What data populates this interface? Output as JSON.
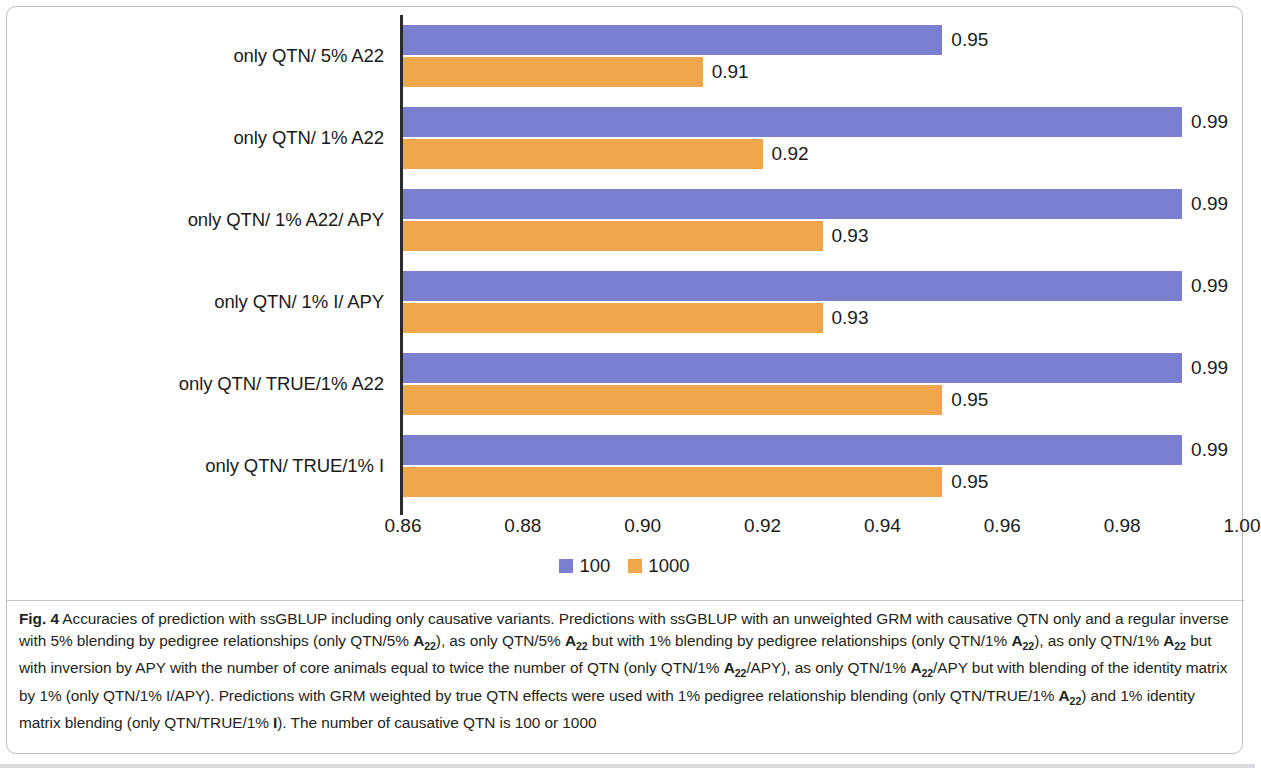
{
  "figure": {
    "label": "Fig. 4",
    "caption_segments": [
      {
        "text": "Fig. 4",
        "style": "bold"
      },
      {
        "text": "  Accuracies of prediction with ssGBLUP including only causative variants. Predictions with ssGBLUP with an unweighted GRM with causative QTN only and a regular inverse with 5% blending by pedigree relationships (only QTN/5% ",
        "style": "normal"
      },
      {
        "text": "A",
        "style": "matrix"
      },
      {
        "text": "22",
        "style": "subscript"
      },
      {
        "text": "), as only QTN/5% ",
        "style": "normal"
      },
      {
        "text": "A",
        "style": "matrix"
      },
      {
        "text": "22",
        "style": "subscript"
      },
      {
        "text": " but with 1% blending by pedigree relationships (only QTN/1% ",
        "style": "normal"
      },
      {
        "text": "A",
        "style": "matrix"
      },
      {
        "text": "22",
        "style": "subscript"
      },
      {
        "text": "), as only QTN/1% ",
        "style": "normal"
      },
      {
        "text": "A",
        "style": "matrix"
      },
      {
        "text": "22",
        "style": "subscript"
      },
      {
        "text": " but with inversion by APY with the number of core animals equal to twice the number of QTN (only QTN/1% ",
        "style": "normal"
      },
      {
        "text": "A",
        "style": "matrix"
      },
      {
        "text": "22",
        "style": "subscript"
      },
      {
        "text": "/APY), as only QTN/1% ",
        "style": "normal"
      },
      {
        "text": "A",
        "style": "matrix"
      },
      {
        "text": "22",
        "style": "subscript"
      },
      {
        "text": "/APY but with blending of the identity matrix by 1% (only QTN/1% I/APY). Predictions with GRM weighted by true QTN effects were used with 1% pedigree relationship blending (only QTN/TRUE/1% ",
        "style": "normal"
      },
      {
        "text": "A",
        "style": "matrix"
      },
      {
        "text": "22",
        "style": "subscript"
      },
      {
        "text": ") and 1% identity matrix blending (only QTN/TRUE/1% ",
        "style": "normal"
      },
      {
        "text": "I",
        "style": "matrix"
      },
      {
        "text": "). The number of causative QTN is 100 or 1000",
        "style": "normal"
      }
    ]
  },
  "chart_data": {
    "type": "bar",
    "orientation": "horizontal",
    "title": "",
    "xlabel": "",
    "ylabel": "",
    "xlim": [
      0.86,
      1.0
    ],
    "xticks": [
      "0.86",
      "0.88",
      "0.90",
      "0.92",
      "0.94",
      "0.96",
      "0.98",
      "1.00"
    ],
    "xtick_values": [
      0.86,
      0.88,
      0.9,
      0.92,
      0.94,
      0.96,
      0.98,
      1.0
    ],
    "grid": false,
    "legend_position": "bottom-center",
    "categories": [
      "only QTN/ 5% A22",
      "only QTN/ 1% A22",
      "only QTN/ 1% A22/ APY",
      "only QTN/ 1% I/ APY",
      "only QTN/ TRUE/1% A22",
      "only QTN/ TRUE/1% I"
    ],
    "series": [
      {
        "name": "100",
        "color": "#7a80cd",
        "values": [
          0.95,
          0.99,
          0.99,
          0.99,
          0.99,
          0.99
        ],
        "labels": [
          "0.95",
          "0.99",
          "0.99",
          "0.99",
          "0.99",
          "0.99"
        ]
      },
      {
        "name": "1000",
        "color": "#f0a64a",
        "values": [
          0.91,
          0.92,
          0.93,
          0.93,
          0.95,
          0.95
        ],
        "labels": [
          "0.91",
          "0.92",
          "0.93",
          "0.93",
          "0.95",
          "0.95"
        ]
      }
    ]
  }
}
